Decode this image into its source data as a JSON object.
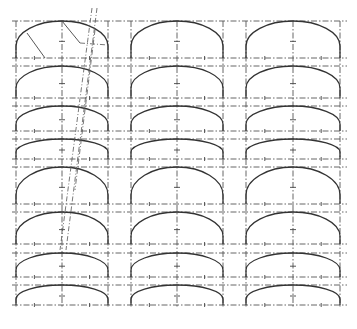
{
  "drawing": {
    "type": "technical-drawing",
    "subject": "grid of segmental/elliptical arch profiles",
    "colors": {
      "background": "#ffffff",
      "line": "#333333",
      "guide": "#555555"
    },
    "columns": [
      {
        "left": 16,
        "right": 108,
        "center": 62
      },
      {
        "left": 131,
        "right": 223,
        "center": 177
      },
      {
        "left": 246,
        "right": 340,
        "center": 293
      }
    ],
    "rows": [
      {
        "top": 21,
        "spring": 46,
        "base": 58
      },
      {
        "top": 66,
        "spring": 88,
        "base": 98
      },
      {
        "top": 106,
        "spring": 124,
        "base": 131
      },
      {
        "top": 139,
        "spring": 152,
        "base": 159
      },
      {
        "top": 167,
        "spring": 195,
        "base": 204
      },
      {
        "top": 212,
        "spring": 236,
        "base": 244
      },
      {
        "top": 253,
        "spring": 270,
        "base": 277
      },
      {
        "top": 285,
        "spring": 299,
        "base": 305
      }
    ],
    "construction_lines": [
      {
        "x1": 92,
        "y1": 8,
        "x2": 60,
        "y2": 250
      },
      {
        "x1": 97,
        "y1": 8,
        "x2": 66,
        "y2": 250
      },
      {
        "x1": 95,
        "y1": 30,
        "x2": 75,
        "y2": 190
      }
    ],
    "radii": [
      {
        "x1": 27,
        "y1": 33,
        "x2": 45,
        "y2": 58
      },
      {
        "x1": 62,
        "y1": 21,
        "x2": 80,
        "y2": 43
      }
    ]
  }
}
